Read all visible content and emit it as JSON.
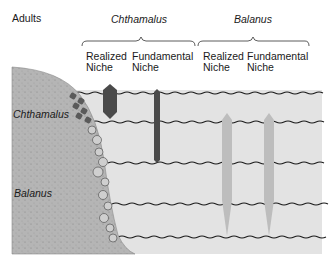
{
  "diagram": {
    "title": "Adults",
    "species": [
      {
        "name": "Chthamalus",
        "niches": [
          {
            "label_line1": "Realized",
            "label_line2": "Niche",
            "color": "#4a4a4a"
          },
          {
            "label_line1": "Fundamental",
            "label_line2": "Niche",
            "color": "#4a4a4a"
          }
        ]
      },
      {
        "name": "Balanus",
        "niches": [
          {
            "label_line1": "Realized",
            "label_line2": "Niche",
            "color": "#bdbdbd"
          },
          {
            "label_line1": "Fundamental",
            "label_line2": "Niche",
            "color": "#bdbdbd"
          }
        ]
      }
    ],
    "rock_labels": {
      "upper": "Chthamalus",
      "lower": "Balanus"
    },
    "colors": {
      "water": "#e4e4e4",
      "rock": "#b8b8b8",
      "tide_line": "#1a1a1a"
    }
  }
}
